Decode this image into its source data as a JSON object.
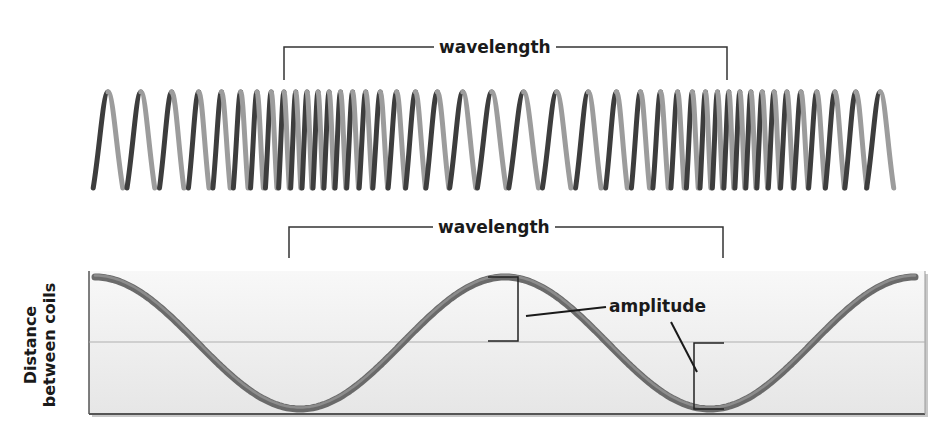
{
  "diagram": {
    "top": {
      "title": "Compressional wave on a spring (coil)",
      "wavelength_label": "wavelength",
      "bracket": {
        "x_start": 284,
        "x_end": 727,
        "y": 47,
        "tick_bottom": 80
      }
    },
    "bottom": {
      "wavelength_label": "wavelength",
      "bracket": {
        "x_start": 289,
        "x_end": 723,
        "y": 227,
        "tick_bottom": 258
      },
      "y_axis_label_line1": "Distance",
      "y_axis_label_line2": "between coils",
      "amplitude_label": "amplitude"
    },
    "colors": {
      "coil_dark": "#3a3a3a",
      "coil_light": "#9a9a9a",
      "graph_bg_top": "#f7f7f7",
      "graph_bg_bottom": "#e9e9e9",
      "midline": "#b5b5b5",
      "wave": "#6e6e6e",
      "text": "#1a1a1a"
    }
  },
  "chart_data": {
    "type": "line",
    "title": "",
    "xlabel": "",
    "ylabel": "Distance between coils",
    "x": [
      0,
      0.25,
      0.5,
      0.75,
      1.0,
      1.25,
      1.5,
      1.75,
      2.0
    ],
    "values": [
      1,
      0,
      -1,
      0,
      1,
      0,
      -1,
      0,
      1
    ],
    "annotations": [
      "wavelength",
      "amplitude"
    ],
    "grid": false,
    "midline": 0
  }
}
